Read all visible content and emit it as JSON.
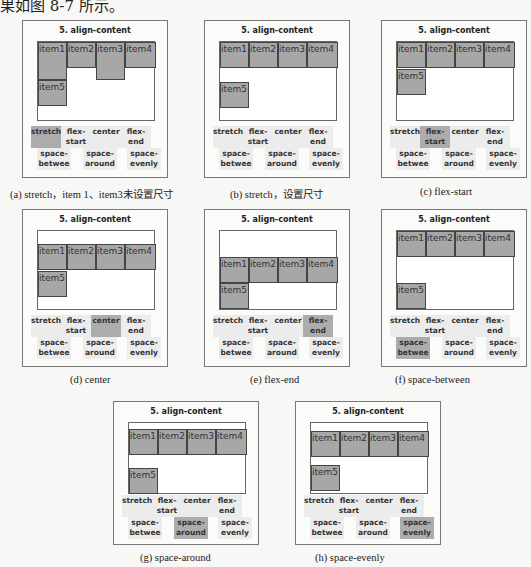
{
  "intro": "果如图 8-7 所示。",
  "panel_title": "5. align-content",
  "items": [
    "item1",
    "item2",
    "item3",
    "item4",
    "item5"
  ],
  "buttons": [
    "stretch",
    "flex-start",
    "center",
    "flex-end",
    "space-betwee",
    "space-around",
    "space-evenly"
  ],
  "accent_active": "#acacac",
  "panels": [
    {
      "caption": "(a) stretch，item 1、item3未设置尺寸",
      "active": "stretch"
    },
    {
      "caption": "(b) stretch，设置尺寸",
      "active": "none"
    },
    {
      "caption": "(c) flex-start",
      "active": "flex-start"
    },
    {
      "caption": "(d) center",
      "active": "center"
    },
    {
      "caption": "(e) flex-end",
      "active": "flex-end"
    },
    {
      "caption": "(f) space-between",
      "active": "space-betwee"
    },
    {
      "caption": "(g) space-around",
      "active": "space-around"
    },
    {
      "caption": "(h) space-evenly",
      "active": "space-evenly"
    }
  ]
}
